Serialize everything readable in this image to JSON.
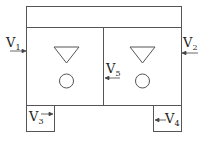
{
  "diagram": {
    "type": "tank-flow-schematic",
    "line_color": "#555555",
    "labels": {
      "v1": {
        "base": "V",
        "sub": "1"
      },
      "v2": {
        "base": "V",
        "sub": "2"
      },
      "v3": {
        "base": "V",
        "sub": "3"
      },
      "v4": {
        "base": "V",
        "sub": "4"
      },
      "v5": {
        "base": "V",
        "sub": "5"
      }
    },
    "symbols": {
      "liquid_level": "inverted-triangle",
      "stirrer": "circle"
    },
    "compartments": [
      "left-tank",
      "right-tank"
    ]
  }
}
